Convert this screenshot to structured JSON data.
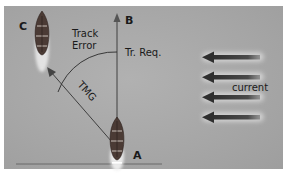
{
  "diagram": {
    "points": {
      "a": "A",
      "b": "B",
      "c": "C"
    },
    "labels": {
      "track_error_line1": "Track",
      "track_error_line2": "Error",
      "track_required": "Tr. Req.",
      "tmg": "TMG",
      "current": "current"
    },
    "current_arrows_count": 4,
    "colors": {
      "background": "#a8a8a8",
      "line": "#2a2a2a",
      "arrow": "#3a3a3a",
      "boat_hull": "#4a3a34",
      "wake": "#e6e6e6"
    }
  }
}
